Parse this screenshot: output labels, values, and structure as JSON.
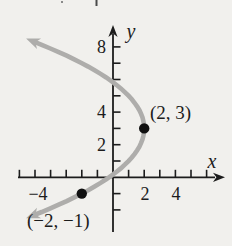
{
  "figure": {
    "background_color": "#f1f0ed",
    "curve_color": "#aeadab",
    "axis_color": "#1c1c1c",
    "point_color": "#101010",
    "text_color": "#1c1c1c"
  },
  "chart_data": {
    "type": "line",
    "title": "",
    "curve_description": "leftward-opening parabola with vertex at (2, 3), gray stroke, arrowheads on both ends",
    "equation": "x = 2 - (y - 3)^2 / 4",
    "coefficient": -0.25,
    "vertex": {
      "x": 2,
      "y": 3
    },
    "y_drawn_range": [
      -2.35,
      8.35
    ],
    "marked_points": [
      {
        "x": 2,
        "y": 3,
        "label": "(2, 3)"
      },
      {
        "x": -2,
        "y": -1,
        "label": "(−2, −1)"
      }
    ],
    "x_axis": {
      "label": "x",
      "tick_step": 1,
      "ticks": [
        -6,
        -5,
        -4,
        -3,
        -2,
        -1,
        1,
        2,
        3,
        4,
        5,
        6
      ],
      "labeled_ticks": [
        {
          "value": -4,
          "label": "−4"
        },
        {
          "value": 2,
          "label": "2"
        },
        {
          "value": 4,
          "label": "4"
        }
      ]
    },
    "y_axis": {
      "label": "y",
      "tick_step": 1,
      "ticks": [
        -2,
        -1,
        1,
        2,
        3,
        4,
        5,
        6,
        7,
        8
      ],
      "labeled_ticks": [
        {
          "value": 2,
          "label": "2"
        },
        {
          "value": 4,
          "label": "4"
        },
        {
          "value": 8,
          "label": "8"
        }
      ]
    },
    "grid": false,
    "legend": false
  }
}
